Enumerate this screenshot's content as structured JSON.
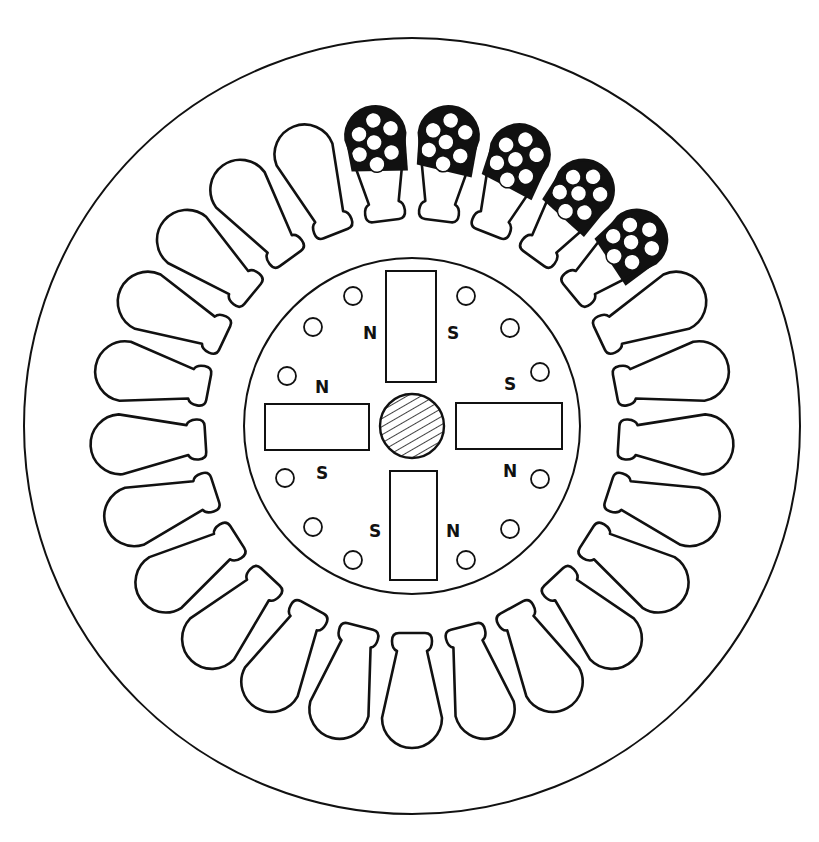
{
  "figure": {
    "type": "cross-section",
    "colors": {
      "stroke": "#111111",
      "background": "#ffffff",
      "winding_fill": "#111111"
    },
    "center": [
      412,
      426
    ],
    "stator": {
      "outer_radius": 388,
      "bore_radius": 207,
      "slot_count": 25,
      "first_slot_angle_deg": -7.2,
      "wound_slot_indices": [
        0,
        1,
        2,
        3,
        4
      ],
      "conductors_per_wound_slot": 7
    },
    "rotor": {
      "radius": 168,
      "shaft_radius": 32,
      "shaft_pattern": "hatched",
      "magnets": [
        {
          "name": "top",
          "x": 386,
          "y": 271,
          "w": 50,
          "h": 111
        },
        {
          "name": "bottom",
          "x": 390,
          "y": 471,
          "w": 47,
          "h": 109
        },
        {
          "name": "left",
          "x": 265,
          "y": 404,
          "w": 104,
          "h": 46
        },
        {
          "name": "right",
          "x": 456,
          "y": 403,
          "w": 106,
          "h": 46
        }
      ],
      "holes": [
        [
          353,
          296
        ],
        [
          313,
          327
        ],
        [
          287,
          376
        ],
        [
          285,
          478
        ],
        [
          313,
          527
        ],
        [
          353,
          560
        ],
        [
          466,
          296
        ],
        [
          510,
          328
        ],
        [
          540,
          372
        ],
        [
          540,
          479
        ],
        [
          510,
          529
        ],
        [
          466,
          560
        ]
      ],
      "hole_radius": 9,
      "pole_labels": [
        {
          "text": "N",
          "x": 370,
          "y": 339
        },
        {
          "text": "S",
          "x": 453,
          "y": 339
        },
        {
          "text": "N",
          "x": 322,
          "y": 393
        },
        {
          "text": "S",
          "x": 510,
          "y": 390
        },
        {
          "text": "S",
          "x": 322,
          "y": 479
        },
        {
          "text": "N",
          "x": 510,
          "y": 477
        },
        {
          "text": "S",
          "x": 375,
          "y": 537
        },
        {
          "text": "N",
          "x": 453,
          "y": 537
        }
      ]
    }
  }
}
